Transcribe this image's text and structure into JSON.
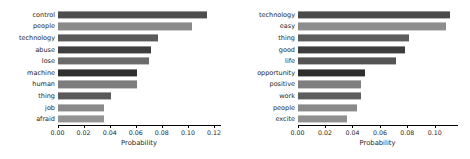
{
  "figure": {
    "background": "#ffffff",
    "text_color": "#262626",
    "axis_color": "#000000"
  },
  "chart_data": [
    {
      "type": "bar",
      "orientation": "horizontal",
      "panel": "left",
      "title": "",
      "xlabel": "Probability",
      "ylabel": "",
      "categories": [
        "control",
        "people",
        "technology",
        "abuse",
        "lose",
        "machine",
        "human",
        "thing",
        "job",
        "afraid"
      ],
      "values": [
        0.115,
        0.103,
        0.077,
        0.072,
        0.07,
        0.061,
        0.061,
        0.041,
        0.036,
        0.036
      ],
      "xlim": [
        0.0,
        0.125
      ],
      "ylim_categories": 10,
      "xticks": [
        0.0,
        0.02,
        0.04,
        0.06,
        0.08,
        0.1,
        0.12
      ],
      "xtick_labels": [
        "0.00",
        "0.02",
        "0.04",
        "0.06",
        "0.08",
        "0.10",
        "0.12"
      ],
      "grid": false,
      "legend": null,
      "bar_colors": [
        "#4d4d4d",
        "#8a8a8a",
        "#5a5a5a",
        "#3f3f3f",
        "#6b6b6b",
        "#2f2f2f",
        "#7d7d7d",
        "#5a5a5a",
        "#8a8a8a",
        "#949494"
      ]
    },
    {
      "type": "bar",
      "orientation": "horizontal",
      "panel": "right",
      "title": "",
      "xlabel": "Probability",
      "ylabel": "",
      "categories": [
        "technology",
        "easy",
        "thing",
        "good",
        "life",
        "opportunity",
        "positive",
        "work",
        "people",
        "excite"
      ],
      "values": [
        0.111,
        0.108,
        0.081,
        0.078,
        0.072,
        0.049,
        0.046,
        0.046,
        0.043,
        0.036
      ],
      "xlim": [
        0.0,
        0.1165
      ],
      "ylim_categories": 10,
      "xticks": [
        0.0,
        0.02,
        0.04,
        0.06,
        0.08,
        0.1
      ],
      "xtick_labels": [
        "0.00",
        "0.02",
        "0.04",
        "0.06",
        "0.08",
        "0.10"
      ],
      "grid": false,
      "legend": null,
      "bar_colors": [
        "#4a4a4a",
        "#8d8d8d",
        "#5c5c5c",
        "#3d3d3d",
        "#545454",
        "#2e2e2e",
        "#7f7f7f",
        "#5e5e5e",
        "#8a8a8a",
        "#909090"
      ]
    }
  ]
}
